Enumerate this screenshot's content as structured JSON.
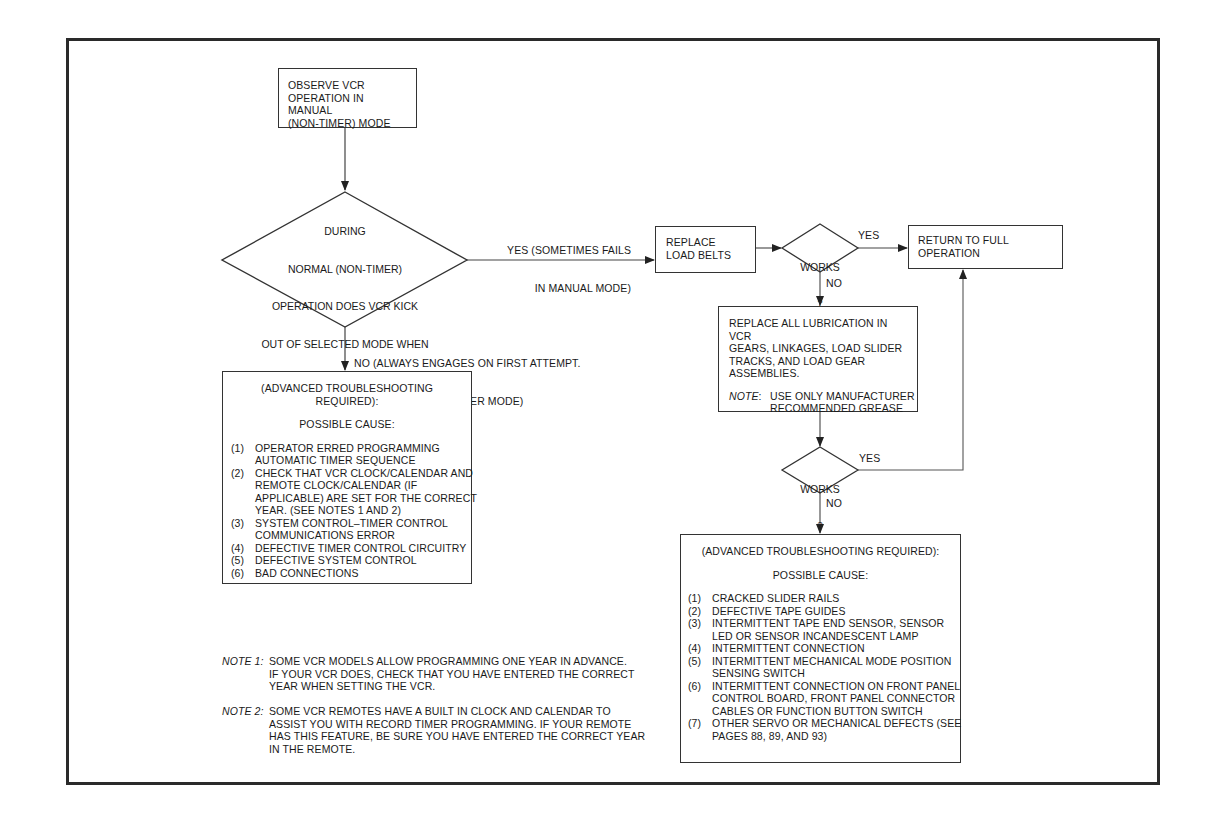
{
  "flowchart": {
    "start": {
      "lines": [
        "OBSERVE VCR",
        "OPERATION IN MANUAL",
        "(NON-TIMER) MODE"
      ]
    },
    "decision_main": {
      "lines": [
        "DURING",
        "NORMAL (NON-TIMER)",
        "OPERATION DOES VCR KICK",
        "OUT OF SELECTED MODE WHEN",
        "SELECT BUTTON FIRST DEPRESSED",
        "(WILL ENGAGE ON SECOND OR",
        "THIRD TRY)",
        "?"
      ]
    },
    "edge_yes_main": {
      "lines": [
        "YES (SOMETIMES FAILS",
        "IN MANUAL MODE)"
      ]
    },
    "edge_no_main": {
      "lines": [
        "NO (ALWAYS ENGAGES ON FIRST ATTEMPT.",
        "FAILS ONLY IN TIMER MODE)"
      ]
    },
    "left_advanced": {
      "header": "(ADVANCED TROUBLESHOOTING REQUIRED):",
      "subheader": "POSSIBLE CAUSE:",
      "items": [
        {
          "num": "(1)",
          "text": "OPERATOR ERRED PROGRAMMING\nAUTOMATIC TIMER SEQUENCE"
        },
        {
          "num": "(2)",
          "text": "CHECK THAT VCR CLOCK/CALENDAR AND\nREMOTE CLOCK/CALENDAR (IF\nAPPLICABLE) ARE SET FOR THE CORRECT\nYEAR. (SEE NOTES 1 AND 2)"
        },
        {
          "num": "(3)",
          "text": "SYSTEM CONTROL–TIMER CONTROL\nCOMMUNICATIONS ERROR"
        },
        {
          "num": "(4)",
          "text": "DEFECTIVE TIMER CONTROL CIRCUITRY"
        },
        {
          "num": "(5)",
          "text": "DEFECTIVE SYSTEM CONTROL"
        },
        {
          "num": "(6)",
          "text": "BAD CONNECTIONS"
        }
      ]
    },
    "replace_belts": {
      "lines": [
        "REPLACE",
        "LOAD BELTS"
      ]
    },
    "works_1": {
      "label": "WORKS",
      "q": "?",
      "yes": "YES",
      "no": "NO"
    },
    "return_full": {
      "lines": [
        "RETURN TO FULL",
        "OPERATION"
      ]
    },
    "lubrication": {
      "lines": [
        "REPLACE ALL LUBRICATION IN VCR",
        "GEARS, LINKAGES, LOAD SLIDER",
        "TRACKS, AND LOAD GEAR",
        "ASSEMBLIES."
      ],
      "note_label": "NOTE",
      "note_text": "USE ONLY MANUFACTURER\nRECOMMENDED GREASE"
    },
    "works_2": {
      "label": "WORKS",
      "q": "?",
      "yes": "YES",
      "no": "NO"
    },
    "right_advanced": {
      "header": "(ADVANCED TROUBLESHOOTING REQUIRED):",
      "subheader": "POSSIBLE CAUSE:",
      "items": [
        {
          "num": "(1)",
          "text": "CRACKED SLIDER RAILS"
        },
        {
          "num": "(2)",
          "text": "DEFECTIVE TAPE GUIDES"
        },
        {
          "num": "(3)",
          "text": "INTERMITTENT TAPE END SENSOR, SENSOR\nLED OR SENSOR INCANDESCENT LAMP"
        },
        {
          "num": "(4)",
          "text": "INTERMITTENT CONNECTION"
        },
        {
          "num": "(5)",
          "text": "INTERMITTENT MECHANICAL MODE POSITION\nSENSING SWITCH"
        },
        {
          "num": "(6)",
          "text": "INTERMITTENT CONNECTION ON FRONT PANEL\nCONTROL BOARD, FRONT PANEL CONNECTOR\nCABLES OR FUNCTION BUTTON SWITCH"
        },
        {
          "num": "(7)",
          "text": "OTHER SERVO OR MECHANICAL DEFECTS (SEE\nPAGES 88, 89, AND 93)"
        }
      ]
    },
    "notes": [
      {
        "label": "NOTE 1:",
        "text": "SOME VCR MODELS ALLOW PROGRAMMING ONE YEAR IN ADVANCE.\nIF YOUR VCR DOES, CHECK THAT YOU HAVE ENTERED THE CORRECT\nYEAR WHEN SETTING THE VCR."
      },
      {
        "label": "NOTE 2:",
        "text": "SOME VCR REMOTES HAVE A BUILT IN CLOCK AND CALENDAR TO\nASSIST YOU WITH RECORD TIMER PROGRAMMING. IF YOUR REMOTE\nHAS THIS FEATURE, BE SURE YOU HAVE ENTERED THE CORRECT YEAR\nIN THE REMOTE."
      }
    ]
  },
  "colors": {
    "line": "#333333",
    "frame": "#2a2a2a",
    "background": "#ffffff",
    "text": "#1a1a1a"
  }
}
